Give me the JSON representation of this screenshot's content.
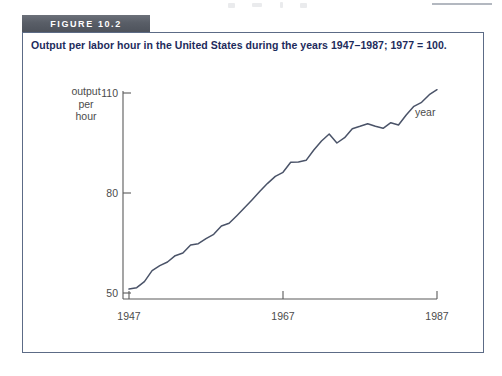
{
  "figure": {
    "tab_label": "FIGURE 10.2",
    "caption": "Output per labor hour in the United States during the years 1947–1987; 1977 = 100."
  },
  "axes": {
    "y_axis_label_line1": "output",
    "y_axis_label_line2": "per",
    "y_axis_label_line3": "hour",
    "x_axis_label": "year",
    "y_ticks": [
      "110",
      "80",
      "50"
    ],
    "x_ticks": [
      "1947",
      "1967",
      "1987"
    ]
  },
  "chart_data": {
    "type": "line",
    "title": "Output per labor hour in the United States during the years 1947–1987; 1977 = 100.",
    "xlabel": "year",
    "ylabel": "output per hour",
    "xlim": [
      1947,
      1987
    ],
    "ylim": [
      50,
      113
    ],
    "ytick_values": [
      50,
      80,
      110
    ],
    "xtick_values": [
      1947,
      1967,
      1987
    ],
    "grid": false,
    "legend": "none",
    "series": [
      {
        "name": "Output per labor hour (1977 = 100)",
        "color": "#4a5368",
        "x": [
          1947,
          1948,
          1949,
          1950,
          1951,
          1952,
          1953,
          1954,
          1955,
          1956,
          1957,
          1958,
          1959,
          1960,
          1961,
          1962,
          1963,
          1964,
          1965,
          1966,
          1967,
          1968,
          1969,
          1970,
          1971,
          1972,
          1973,
          1974,
          1975,
          1976,
          1977,
          1978,
          1979,
          1980,
          1981,
          1982,
          1983,
          1984,
          1985,
          1986,
          1987
        ],
        "values": [
          51.2,
          51.6,
          53.4,
          56.7,
          58.2,
          59.3,
          61.2,
          62.0,
          64.4,
          64.8,
          66.3,
          67.6,
          70.1,
          70.9,
          73.2,
          75.6,
          78.0,
          80.5,
          82.9,
          85.0,
          86.2,
          89.2,
          89.3,
          89.8,
          92.9,
          95.6,
          97.7,
          95.0,
          96.6,
          99.3,
          100.0,
          100.8,
          100.0,
          99.4,
          101.1,
          100.4,
          103.4,
          106.0,
          107.2,
          109.5,
          111.0
        ]
      }
    ]
  }
}
